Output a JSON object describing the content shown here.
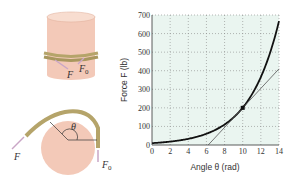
{
  "illustration": {
    "top_labels": {
      "F": "F",
      "F0": "F",
      "F0_sub": "0"
    },
    "bottom_labels": {
      "F": "F",
      "F0": "F",
      "F0_sub": "0",
      "theta": "θ"
    },
    "colors": {
      "drum": "#f3c9b8",
      "drum_top": "#f8ddd0",
      "rope": "#b5a46a",
      "arrow": "#c9a6c6"
    }
  },
  "chart_data": {
    "type": "line",
    "title": "",
    "xlabel": "Angle θ (rad)",
    "ylabel": "Force F (lb)",
    "xlim": [
      0,
      14
    ],
    "ylim": [
      0,
      700
    ],
    "xticks": [
      0,
      2,
      4,
      6,
      8,
      10,
      12,
      14
    ],
    "yticks": [
      0,
      100,
      200,
      300,
      400,
      500,
      600,
      700
    ],
    "grid": true,
    "background": "#eaf5f0",
    "series": [
      {
        "name": "F = F0·e^(0.3θ)",
        "type": "curve",
        "F0": 10,
        "mu": 0.3,
        "color": "#111111"
      },
      {
        "name": "tangent at θ=10",
        "type": "line",
        "points": [
          [
            6.2,
            0
          ],
          [
            14,
            410
          ]
        ],
        "color": "#555555"
      }
    ],
    "marked_point": {
      "x": 10,
      "y": 200
    }
  }
}
